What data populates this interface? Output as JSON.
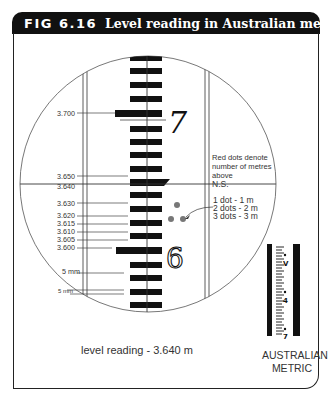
{
  "header": {
    "figure_number": "FIG 6.16",
    "caption": "Level reading in Australian metric"
  },
  "staff_labels": [
    {
      "text": "3.700",
      "y": 113
    },
    {
      "text": "3.650",
      "y": 176
    },
    {
      "text": "3.640",
      "y": 187
    },
    {
      "text": "3.630",
      "y": 203
    },
    {
      "text": "3.620",
      "y": 216
    },
    {
      "text": "3.615",
      "y": 224
    },
    {
      "text": "3.610",
      "y": 232
    },
    {
      "text": "3.605",
      "y": 240
    },
    {
      "text": "3.600",
      "y": 248
    },
    {
      "text": "5 mm",
      "y": 274
    },
    {
      "text": "5 mm",
      "y": 295
    }
  ],
  "staff_numerals": {
    "upper": "7",
    "lower": "6"
  },
  "legend": {
    "intro_line1": "Red dots denote",
    "intro_line2": "number of metres",
    "intro_line3": "above",
    "intro_line4": "N.S.",
    "item1": "1 dot  - 1 m",
    "item2": "2 dots - 2 m",
    "item3": "3 dots - 3 m",
    "dot_color": "#777777"
  },
  "reading": {
    "text": "level reading - 3.640 m"
  },
  "inset": {
    "label_line1": "AUSTRALIAN",
    "label_line2": "METRIC",
    "numerals": [
      "V",
      "4",
      "7"
    ]
  }
}
